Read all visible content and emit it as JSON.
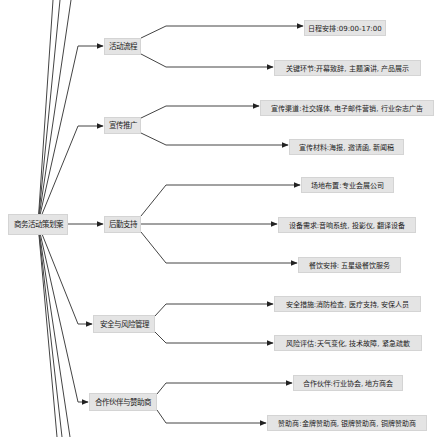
{
  "diagram": {
    "type": "mind-map",
    "colors": {
      "node_bg": "#e4e4e4",
      "edge": "#333333",
      "background": "#ffffff"
    },
    "root": {
      "label": "商务活动策划案"
    },
    "branches": [
      {
        "label": "活动流程",
        "children": [
          {
            "label": "日程安排:09:00-17:00"
          },
          {
            "label": "关键环节:开幕致辞, 主题演讲, 产品展示"
          }
        ]
      },
      {
        "label": "宣传推广",
        "children": [
          {
            "label": "宣传渠道:社交媒体, 电子邮件营销, 行业杂志广告"
          },
          {
            "label": "宣传材料:海报, 邀请函, 新闻稿"
          }
        ]
      },
      {
        "label": "后勤支持",
        "children": [
          {
            "label": "场地布置:专业会展公司"
          },
          {
            "label": "设备需求:音响系统, 投影仪, 翻译设备"
          },
          {
            "label": "餐饮安排: 五星级餐饮服务"
          }
        ]
      },
      {
        "label": "安全与风险管理",
        "children": [
          {
            "label": "安全措施:消防检查, 医疗支持, 安保人员"
          },
          {
            "label": "风险评估:天气变化, 技术故障, 紧急疏散"
          }
        ]
      },
      {
        "label": "合作伙伴与赞助商",
        "children": [
          {
            "label": "合作伙伴:行业协会, 地方商会"
          },
          {
            "label": "赞助商:金牌赞助商, 银牌赞助商, 铜牌赞助商"
          }
        ]
      }
    ]
  }
}
